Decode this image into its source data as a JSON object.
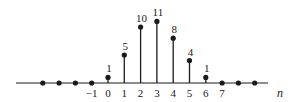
{
  "chart_data": {
    "type": "stem",
    "title": "",
    "xlabel": "n",
    "ylabel": "",
    "x": [
      -4,
      -3,
      -2,
      -1,
      0,
      1,
      2,
      3,
      4,
      5,
      6,
      7,
      8,
      9
    ],
    "values": [
      0,
      0,
      0,
      0,
      1,
      5,
      10,
      11,
      8,
      4,
      1,
      0,
      0,
      0
    ],
    "data_labels": [
      {
        "n": 0,
        "label": "1"
      },
      {
        "n": 1,
        "label": "5"
      },
      {
        "n": 2,
        "label": "10"
      },
      {
        "n": 3,
        "label": "11"
      },
      {
        "n": 4,
        "label": "8"
      },
      {
        "n": 5,
        "label": "4"
      },
      {
        "n": 6,
        "label": "1"
      }
    ],
    "tick_labels": [
      "-1",
      "0",
      "1",
      "2",
      "3",
      "4",
      "5",
      "6",
      "7"
    ],
    "tick_positions": [
      -1,
      0,
      1,
      2,
      3,
      4,
      5,
      6,
      7
    ],
    "ylim": [
      0,
      11
    ],
    "grid": false,
    "legend": null
  },
  "layout": {
    "axis_y": 83,
    "x_origin": 108,
    "x_step": 16.3,
    "y_scale": 5.6,
    "axis_x_start": 16,
    "axis_x_end": 268,
    "xlabel_x": 277,
    "color": "#1a1a1a"
  }
}
